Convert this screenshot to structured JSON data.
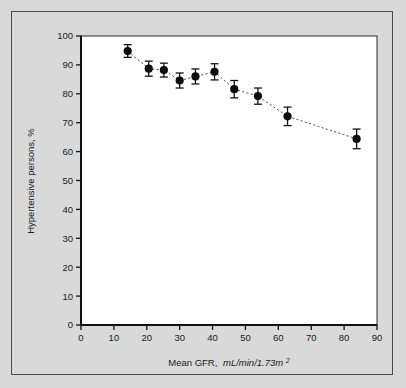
{
  "figure": {
    "background_color": "#d9d9d9",
    "plot_background_color": "#ffffff",
    "border_color": "#4a4a4a"
  },
  "chart_data": {
    "type": "scatter",
    "title": "",
    "subtitle": "",
    "xlabel_main": "Mean GFR,",
    "xlabel_units": "mL/min/1.73m",
    "xlabel_units_sup": "2",
    "ylabel": "Hypertensive persons, %",
    "xlim": [
      0,
      90
    ],
    "ylim": [
      0,
      100
    ],
    "xticks": [
      0,
      10,
      20,
      30,
      40,
      50,
      60,
      70,
      80,
      90
    ],
    "yticks": [
      0,
      10,
      20,
      30,
      40,
      50,
      60,
      70,
      80,
      90,
      100
    ],
    "grid": false,
    "legend": "none",
    "marker": "filled-circle",
    "line_style": "dashed",
    "error_bars": "vertical",
    "series": [
      {
        "name": "Hypertensive persons by mean GFR",
        "x": [
          14.2,
          20.6,
          25.2,
          30.0,
          34.8,
          40.6,
          46.6,
          53.8,
          62.8,
          83.8
        ],
        "y": [
          94.8,
          88.7,
          88.2,
          84.6,
          86.0,
          87.6,
          81.6,
          79.2,
          72.2,
          64.4
        ],
        "yerr_low": [
          2.2,
          2.6,
          2.4,
          2.6,
          2.6,
          2.8,
          3.0,
          2.8,
          3.2,
          3.4
        ],
        "yerr_high": [
          2.2,
          2.6,
          2.4,
          2.6,
          2.6,
          2.8,
          3.0,
          2.8,
          3.2,
          3.4
        ]
      }
    ]
  }
}
